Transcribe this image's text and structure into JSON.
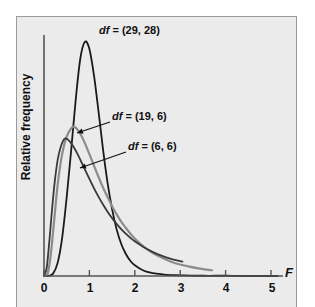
{
  "figure": {
    "background": "#ffffff",
    "panel_color": "#ebebeb",
    "panel_border": "#9a9a9a"
  },
  "axes": {
    "y_label": "Relative frequency",
    "x_label": "F",
    "x_ticks": [
      "0",
      "1",
      "2",
      "3",
      "4",
      "5"
    ]
  },
  "annotations": [
    {
      "name": "label-29-28",
      "df_prefix": "df",
      "text": " = (29, 28)",
      "full": "df = (29, 28)"
    },
    {
      "name": "label-19-6",
      "df_prefix": "df",
      "text": " = (19, 6)",
      "full": "df = (19, 6)"
    },
    {
      "name": "label-6-6",
      "df_prefix": "df",
      "text": " = (6, 6)",
      "full": "df = (6, 6)"
    }
  ],
  "chart_data": {
    "type": "line",
    "title": "",
    "xlabel": "F",
    "ylabel": "Relative frequency",
    "xlim": [
      0,
      5.4
    ],
    "ylim": [
      0,
      1.0
    ],
    "grid": false,
    "legend": "inline-annotations",
    "x_ticks": [
      0,
      1,
      2,
      3,
      4,
      5
    ],
    "y_ticks": [],
    "series": [
      {
        "name": "df = (29, 28)",
        "df": [
          29,
          28
        ],
        "color": "#1a1a1a",
        "linewidth": 1.8,
        "peak_x": 0.9,
        "peak_y": 0.98,
        "x_end": 5.15,
        "points": [
          [
            0.0,
            0.0
          ],
          [
            0.1,
            0.001
          ],
          [
            0.2,
            0.01
          ],
          [
            0.3,
            0.055
          ],
          [
            0.4,
            0.16
          ],
          [
            0.5,
            0.33
          ],
          [
            0.6,
            0.53
          ],
          [
            0.7,
            0.74
          ],
          [
            0.8,
            0.91
          ],
          [
            0.9,
            0.98
          ],
          [
            1.0,
            0.95
          ],
          [
            1.1,
            0.84
          ],
          [
            1.2,
            0.69
          ],
          [
            1.3,
            0.53
          ],
          [
            1.4,
            0.39
          ],
          [
            1.5,
            0.28
          ],
          [
            1.6,
            0.195
          ],
          [
            1.7,
            0.135
          ],
          [
            1.8,
            0.093
          ],
          [
            1.9,
            0.064
          ],
          [
            2.0,
            0.045
          ],
          [
            2.2,
            0.022
          ],
          [
            2.4,
            0.012
          ],
          [
            2.6,
            0.007
          ],
          [
            2.8,
            0.004
          ],
          [
            3.0,
            0.003
          ],
          [
            3.5,
            0.001
          ],
          [
            4.0,
            0.001
          ],
          [
            4.5,
            0.0
          ],
          [
            5.15,
            0.0
          ]
        ]
      },
      {
        "name": "df = (19, 6)",
        "df": [
          19,
          6
        ],
        "color": "#8c8c8c",
        "linewidth": 2.2,
        "peak_x": 0.66,
        "peak_y": 0.625,
        "x_end": 3.7,
        "points": [
          [
            0.0,
            0.0
          ],
          [
            0.08,
            0.01
          ],
          [
            0.15,
            0.09
          ],
          [
            0.22,
            0.225
          ],
          [
            0.3,
            0.38
          ],
          [
            0.38,
            0.49
          ],
          [
            0.46,
            0.56
          ],
          [
            0.54,
            0.6
          ],
          [
            0.62,
            0.622
          ],
          [
            0.66,
            0.625
          ],
          [
            0.74,
            0.612
          ],
          [
            0.82,
            0.588
          ],
          [
            0.9,
            0.556
          ],
          [
            1.0,
            0.51
          ],
          [
            1.1,
            0.462
          ],
          [
            1.2,
            0.415
          ],
          [
            1.3,
            0.37
          ],
          [
            1.4,
            0.33
          ],
          [
            1.5,
            0.292
          ],
          [
            1.6,
            0.258
          ],
          [
            1.7,
            0.228
          ],
          [
            1.8,
            0.202
          ],
          [
            1.9,
            0.178
          ],
          [
            2.0,
            0.157
          ],
          [
            2.2,
            0.122
          ],
          [
            2.4,
            0.096
          ],
          [
            2.6,
            0.076
          ],
          [
            2.8,
            0.06
          ],
          [
            3.0,
            0.048
          ],
          [
            3.2,
            0.039
          ],
          [
            3.4,
            0.032
          ],
          [
            3.7,
            0.024
          ]
        ]
      },
      {
        "name": "df = (6, 6)",
        "df": [
          6,
          6
        ],
        "color": "#3a3a3a",
        "linewidth": 1.8,
        "peak_x": 0.46,
        "peak_y": 0.575,
        "x_end": 3.05,
        "points": [
          [
            0.0,
            0.0
          ],
          [
            0.06,
            0.035
          ],
          [
            0.12,
            0.15
          ],
          [
            0.18,
            0.285
          ],
          [
            0.24,
            0.4
          ],
          [
            0.3,
            0.485
          ],
          [
            0.36,
            0.535
          ],
          [
            0.42,
            0.565
          ],
          [
            0.46,
            0.575
          ],
          [
            0.52,
            0.572
          ],
          [
            0.58,
            0.56
          ],
          [
            0.66,
            0.538
          ],
          [
            0.74,
            0.51
          ],
          [
            0.82,
            0.478
          ],
          [
            0.9,
            0.446
          ],
          [
            1.0,
            0.406
          ],
          [
            1.1,
            0.368
          ],
          [
            1.2,
            0.332
          ],
          [
            1.3,
            0.299
          ],
          [
            1.4,
            0.269
          ],
          [
            1.5,
            0.242
          ],
          [
            1.6,
            0.218
          ],
          [
            1.7,
            0.196
          ],
          [
            1.8,
            0.177
          ],
          [
            1.9,
            0.16
          ],
          [
            2.0,
            0.145
          ],
          [
            2.2,
            0.12
          ],
          [
            2.4,
            0.1
          ],
          [
            2.6,
            0.084
          ],
          [
            2.8,
            0.072
          ],
          [
            3.05,
            0.06
          ]
        ]
      }
    ]
  }
}
